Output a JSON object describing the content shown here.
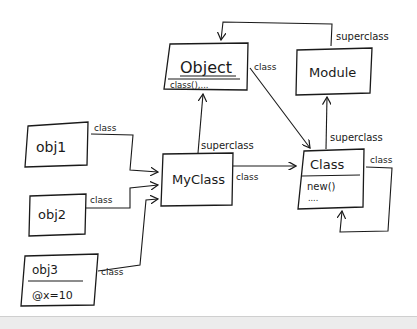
{
  "diagram": {
    "type": "hand-drawn class diagram (Ruby object model)",
    "nodes": [
      {
        "id": "object",
        "title": "Object",
        "methods": "class(),..."
      },
      {
        "id": "module",
        "title": "Module"
      },
      {
        "id": "myclass",
        "title": "MyClass"
      },
      {
        "id": "class",
        "title": "Class",
        "methods": "new()",
        "extra": "...."
      },
      {
        "id": "obj1",
        "title": "obj1"
      },
      {
        "id": "obj2",
        "title": "obj2"
      },
      {
        "id": "obj3",
        "title": "obj3",
        "attributes": "@x=10"
      }
    ],
    "edges": [
      {
        "from": "obj1",
        "to": "myclass",
        "label": "class"
      },
      {
        "from": "obj2",
        "to": "myclass",
        "label": "class"
      },
      {
        "from": "obj3",
        "to": "myclass",
        "label": "class"
      },
      {
        "from": "myclass",
        "to": "object",
        "label": "superclass"
      },
      {
        "from": "myclass",
        "to": "class",
        "label": "class"
      },
      {
        "from": "object",
        "to": "class",
        "label": "class"
      },
      {
        "from": "module",
        "to": "object",
        "label": "superclass"
      },
      {
        "from": "class",
        "to": "module",
        "label": "superclass"
      },
      {
        "from": "class",
        "to": "class",
        "label": "class"
      }
    ]
  }
}
